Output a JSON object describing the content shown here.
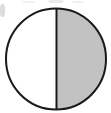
{
  "figure": {
    "name": "half-shaded-circle",
    "kind": "fraction-area-model",
    "shape": "circle",
    "total_parts": 2,
    "shaded_parts": 1,
    "unshaded_parts": 1,
    "fraction_label": "1/2",
    "percent_shaded": 50,
    "decimal_shaded": 0.5,
    "divider_orientation": "vertical",
    "shaded_side": "right",
    "unshaded_side": "left",
    "caption": ""
  },
  "geometry": {
    "canvas_width": 111,
    "canvas_height": 113,
    "center_x": 56,
    "center_y": 59,
    "radius_x": 50,
    "radius_y": 50.5,
    "divider_x": 57,
    "outline_width": 2,
    "divider_width": 2
  },
  "colors": {
    "background": "#ffffff",
    "outline": "#1a1a1a",
    "divider": "#1a1a1a",
    "shaded_fill": "#c2c2c2",
    "unshaded_fill": "#ffffff",
    "artifact": "#8d8d8d"
  },
  "artifacts": [
    {
      "name": "edge-smudge-left",
      "x": 0,
      "y": 4,
      "w": 5,
      "h": 13
    },
    {
      "name": "top-smudge-center",
      "x": 48,
      "y": 0,
      "w": 16,
      "h": 3
    },
    {
      "name": "top-smudge-right",
      "x": 72,
      "y": 1,
      "w": 12,
      "h": 2
    },
    {
      "name": "top-smudge-left",
      "x": 22,
      "y": 1,
      "w": 13,
      "h": 2
    }
  ]
}
